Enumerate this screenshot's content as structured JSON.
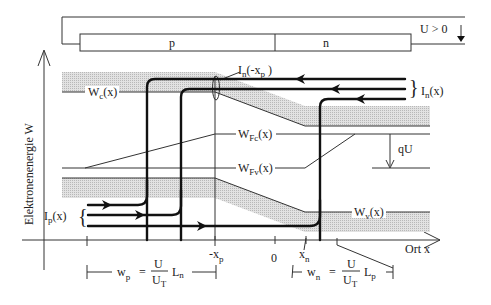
{
  "diagram": {
    "circuit": {
      "p_region_label": "p",
      "n_region_label": "n",
      "voltage_label": "U > 0"
    },
    "axes": {
      "y_label": "Elektronenenergie W",
      "x_label": "Ort x",
      "x_ticks": [
        "-x",
        "0",
        "x"
      ],
      "x_tick_subs": [
        "p",
        "",
        "n"
      ]
    },
    "bands": {
      "wc": {
        "main": "W",
        "sub": "c",
        "arg": "(x)"
      },
      "wfc": {
        "main": "W",
        "sub": "Fc",
        "arg": "(x)"
      },
      "wfv": {
        "main": "W",
        "sub": "Fv",
        "arg": "(x)"
      },
      "wv": {
        "main": "W",
        "sub": "v",
        "arg": "(x)"
      },
      "qu": "qU"
    },
    "currents": {
      "in_xp": {
        "main": "I",
        "sub": "n",
        "arg": "(-x",
        "argsub": "p",
        "close": " )"
      },
      "in_x": {
        "main": "I",
        "sub": "n",
        "arg": "(x)"
      },
      "ip_x": {
        "main": "I",
        "sub": "p",
        "arg": "(x)"
      }
    },
    "widths": {
      "wp": {
        "lhs": "w",
        "lhs_sub": "p",
        "eq": "=",
        "num": "U",
        "den": "U",
        "den_sub": "T",
        "L": "L",
        "L_sub": "n"
      },
      "wn": {
        "lhs": "w",
        "lhs_sub": "n",
        "eq": "=",
        "num": "U",
        "den": "U",
        "den_sub": "T",
        "L": "L",
        "L_sub": "p"
      }
    },
    "colors": {
      "band_shade": "#d4d4d4",
      "line": "#111111"
    }
  }
}
